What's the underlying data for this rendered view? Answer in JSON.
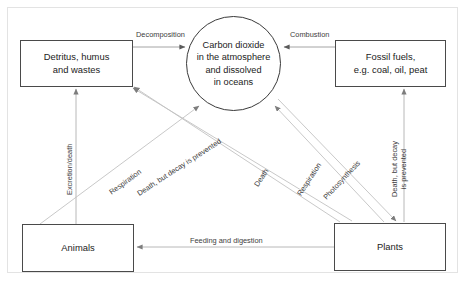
{
  "diagram": {
    "type": "cycle-flow-diagram",
    "nodes": [
      {
        "id": "detritus",
        "label": "Detritus, humus\nand wastes",
        "shape": "rectangle"
      },
      {
        "id": "carbon_dioxide",
        "label": "Carbon dioxide\nin the atmosphere\nand dissolved\nin oceans",
        "shape": "circle"
      },
      {
        "id": "fossil_fuels",
        "label": "Fossil fuels,\ne.g. coal, oil, peat",
        "shape": "rectangle"
      },
      {
        "id": "animals",
        "label": "Animals",
        "shape": "rectangle"
      },
      {
        "id": "plants",
        "label": "Plants",
        "shape": "rectangle"
      }
    ],
    "edges": [
      {
        "id": "decomposition",
        "label": "Decomposition",
        "from": "detritus",
        "to": "carbon_dioxide"
      },
      {
        "id": "combustion",
        "label": "Combustion",
        "from": "fossil_fuels",
        "to": "carbon_dioxide"
      },
      {
        "id": "excretion_death",
        "label": "Excretion/death",
        "from": "animals",
        "to": "detritus"
      },
      {
        "id": "respiration_animals",
        "label": "Respiration",
        "from": "animals",
        "to": "carbon_dioxide"
      },
      {
        "id": "death_decay_prevented_left",
        "label": "Death, but decay is prevented",
        "from": "plants",
        "to": "detritus"
      },
      {
        "id": "death_plants",
        "label": "Death",
        "from": "plants",
        "to": "detritus"
      },
      {
        "id": "respiration_plants",
        "label": "Respiration",
        "from": "plants",
        "to": "carbon_dioxide"
      },
      {
        "id": "photosynthesis",
        "label": "Photosynthesis",
        "from": "carbon_dioxide",
        "to": "plants"
      },
      {
        "id": "death_decay_prevented_right",
        "label": "Death, but decay\nis prevented",
        "from": "plants",
        "to": "fossil_fuels"
      },
      {
        "id": "feeding_digestion",
        "label": "Feeding and digestion",
        "from": "plants",
        "to": "animals"
      }
    ],
    "colors": {
      "node_border": "#4a4a4a",
      "circle_border": "#3a3a3a",
      "arrow": "#b9b9b9",
      "arrow_dark": "#6f6f6f",
      "text": "#222222",
      "label_text": "#3d3d3d",
      "frame": "#e3e3e3",
      "background": "#ffffff"
    }
  }
}
